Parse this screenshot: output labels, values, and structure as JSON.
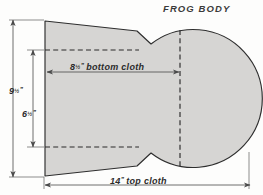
{
  "figure": {
    "title": "FROG BODY",
    "background_color": "#fdfdfc",
    "fill_color": "#d6d5d3",
    "outline_color": "#2e2e2e",
    "dimension_line_color": "#4a4a4a"
  },
  "dimensions": {
    "height_overall": {
      "value": "9",
      "fraction": "1/2",
      "unit": "”",
      "full_label": "9½”",
      "orientation": "vertical",
      "position": "outer-left"
    },
    "height_inner": {
      "value": "6",
      "fraction": "1/2",
      "unit": "”",
      "full_label": "6½”",
      "orientation": "vertical",
      "position": "inner-left"
    },
    "bottom_cloth": {
      "value": "8",
      "fraction": "1/2",
      "unit": "”",
      "text": "bottom cloth",
      "full_label": "8½” bottom cloth",
      "orientation": "horizontal",
      "position": "upper-middle"
    },
    "top_cloth": {
      "value": "14",
      "fraction": "",
      "unit": "”",
      "text": "top cloth",
      "full_label": "14” top cloth",
      "orientation": "horizontal",
      "position": "bottom"
    }
  },
  "shape": {
    "name": "frog-body-pattern",
    "parts": [
      "tapered-neck-panel",
      "round-body-circle",
      "center-fold-line"
    ],
    "outline_path": "M 45,21 L 137,31 L 151,44 A 69 69 0 1 1 151,153 L 137,166 L 45,176 Z",
    "circle": {
      "cx": 180,
      "cy": 98.5,
      "r": 69
    },
    "centerline": {
      "x": 180,
      "y1": 30,
      "y2": 167
    },
    "dashed_reference_lines": [
      {
        "label": "upper-reference",
        "x1": 45,
        "y1": 50,
        "x2": 137,
        "y2": 50
      },
      {
        "label": "lower-reference",
        "x1": 45,
        "y1": 147,
        "x2": 137,
        "y2": 147
      }
    ]
  }
}
